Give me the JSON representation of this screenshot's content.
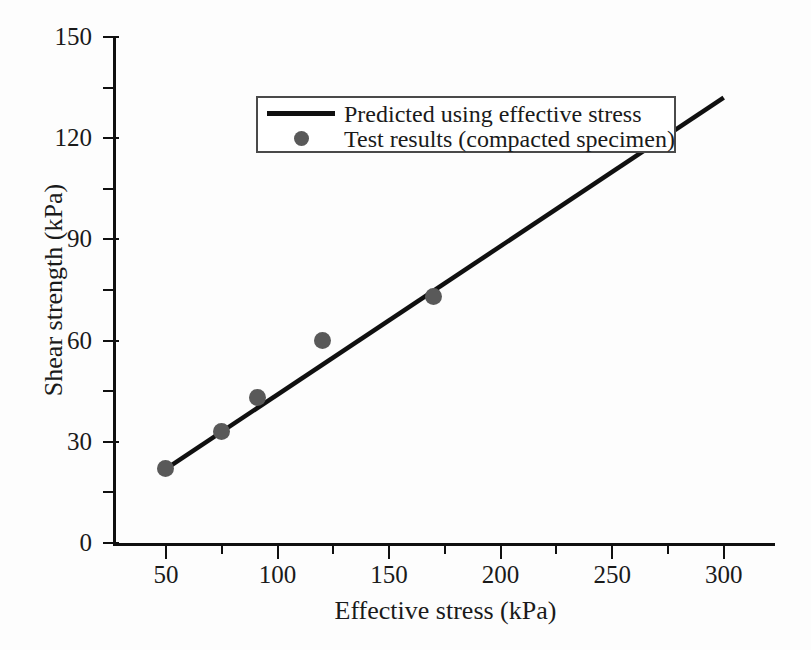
{
  "chart_data": {
    "type": "line",
    "title": "",
    "xlabel": "Effective stress (kPa)",
    "ylabel": "Shear strength (kPa)",
    "xlim": [
      27.6,
      323.0
    ],
    "ylim": [
      0,
      150
    ],
    "xticks": [
      50,
      100,
      150,
      200,
      250,
      300
    ],
    "xtick_labels": [
      "50",
      "100",
      "150",
      "200",
      "250",
      "300"
    ],
    "xminor_ticks": [
      75,
      125,
      175,
      225,
      275
    ],
    "yticks": [
      0,
      30,
      60,
      90,
      120,
      150
    ],
    "ytick_labels": [
      "0",
      "30",
      "60",
      "90",
      "120",
      "150"
    ],
    "yminor_ticks": [
      15,
      45,
      75,
      105,
      135
    ],
    "grid": false,
    "legend_position": "upper left",
    "series": [
      {
        "name": "Predicted using effective stress",
        "type": "line",
        "color": "#101010",
        "x": [
          50,
          300
        ],
        "y": [
          22,
          132
        ]
      },
      {
        "name": "Test results (compacted specimen)",
        "type": "scatter",
        "color": "#595959",
        "x": [
          50,
          75,
          91,
          120,
          170
        ],
        "y": [
          22,
          33,
          43,
          60,
          73
        ]
      }
    ]
  },
  "legend": {
    "entries": [
      {
        "label": "Predicted using effective stress",
        "key": "line-swatch"
      },
      {
        "label": "Test results (compacted specimen)",
        "key": "marker-swatch"
      }
    ]
  },
  "axes": {
    "x_title": "Effective stress (kPa)",
    "y_title": "Shear strength (kPa)"
  }
}
